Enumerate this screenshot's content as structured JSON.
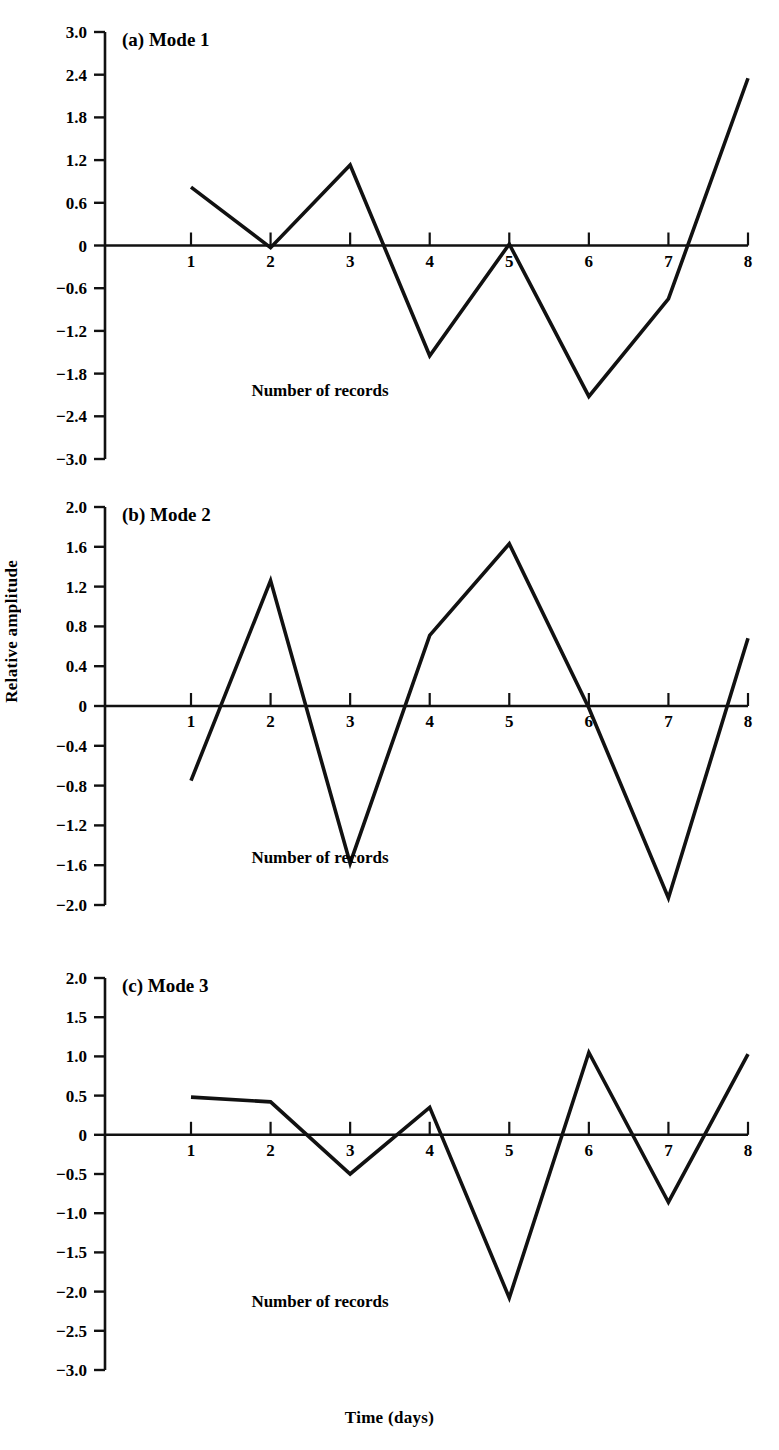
{
  "figure": {
    "y_axis_label": "Relative amplitude",
    "x_axis_label": "Time (days)",
    "inner_label": "Number of records"
  },
  "chart_data": [
    {
      "type": "line",
      "title": "(a) Mode 1",
      "panel": "a",
      "xlabel": "Number of records",
      "ylabel": "Relative amplitude",
      "x": [
        1,
        2,
        3,
        4,
        5,
        6,
        7,
        8
      ],
      "values": [
        0.82,
        -0.03,
        1.13,
        -1.55,
        0.02,
        -2.12,
        -0.75,
        2.35
      ],
      "xticklabels": [
        "1",
        "2",
        "3",
        "4",
        "5",
        "6",
        "7",
        "8"
      ],
      "yticklabels": [
        "3.0",
        "2.4",
        "1.8",
        "1.2",
        "0.6",
        "0",
        "-0.6",
        "-1.2",
        "-1.8",
        "-2.4",
        "-3.0"
      ],
      "yticks": [
        3.0,
        2.4,
        1.8,
        1.2,
        0.6,
        0,
        -0.6,
        -1.2,
        -1.8,
        -2.4,
        -3.0
      ],
      "ylim": [
        -3.0,
        3.0
      ],
      "xlim": [
        0.6,
        8.4
      ],
      "grid": false,
      "legend": "none"
    },
    {
      "type": "line",
      "title": "(b) Mode 2",
      "panel": "b",
      "xlabel": "Number of records",
      "ylabel": "Relative amplitude",
      "x": [
        1,
        2,
        3,
        4,
        5,
        6,
        7,
        8
      ],
      "values": [
        -0.75,
        1.26,
        -1.58,
        0.71,
        1.63,
        -0.02,
        -1.93,
        0.68
      ],
      "xticklabels": [
        "1",
        "2",
        "3",
        "4",
        "5",
        "6",
        "7",
        "8"
      ],
      "yticklabels": [
        "2.0",
        "1.6",
        "1.2",
        "0.8",
        "0.4",
        "0",
        "-0.4",
        "-0.8",
        "-1.2",
        "-1.6",
        "-2.0"
      ],
      "yticks": [
        2.0,
        1.6,
        1.2,
        0.8,
        0.4,
        0,
        -0.4,
        -0.8,
        -1.2,
        -1.6,
        -2.0
      ],
      "ylim": [
        -2.0,
        2.0
      ],
      "xlim": [
        0.6,
        8.4
      ],
      "grid": false,
      "legend": "none"
    },
    {
      "type": "line",
      "title": "(c) Mode 3",
      "panel": "c",
      "xlabel": "Time (days)",
      "ylabel": "Relative amplitude",
      "x": [
        1,
        2,
        3,
        4,
        5,
        6,
        7,
        8
      ],
      "values": [
        0.48,
        0.42,
        -0.5,
        0.35,
        -2.08,
        1.05,
        -0.86,
        1.03
      ],
      "xticklabels": [
        "1",
        "2",
        "3",
        "4",
        "5",
        "6",
        "7",
        "8"
      ],
      "yticklabels": [
        "2.0",
        "1.5",
        "1.0",
        "0.5",
        "0",
        "-0.5",
        "-1.0",
        "-1.5",
        "-2.0",
        "-2.5",
        "-3.0"
      ],
      "yticks": [
        2.0,
        1.5,
        1.0,
        0.5,
        0,
        -0.5,
        -1.0,
        -1.5,
        -2.0,
        -2.5,
        -3.0
      ],
      "ylim": [
        -3.0,
        2.0
      ],
      "xlim": [
        0.6,
        8.4
      ],
      "grid": false,
      "legend": "none"
    }
  ]
}
